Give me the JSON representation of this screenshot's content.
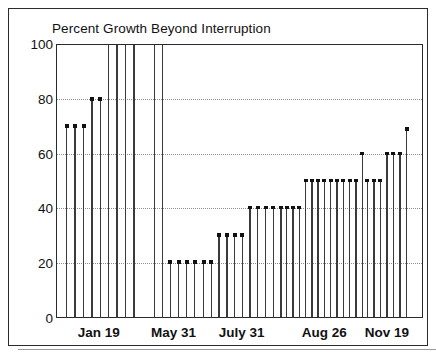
{
  "chart_data": {
    "type": "bar",
    "title": "Percent Growth Beyond Interruption",
    "xlabel": "",
    "ylabel": "",
    "ylim": [
      0,
      100
    ],
    "yticks": [
      0,
      20,
      40,
      60,
      80,
      100
    ],
    "ytick_labels": [
      "0",
      "20",
      "40",
      "60",
      "80",
      "100"
    ],
    "grid": "horizontal-dotted",
    "legend": "none",
    "xtick_labels": [
      "Jan 19",
      "May 31",
      "July 31",
      "Aug 26",
      "Nov 19"
    ],
    "groups": [
      {
        "label": "Jan 19",
        "center_pct": 18.0,
        "values": [
          70,
          70,
          70,
          80,
          80,
          100,
          100,
          100,
          100
        ]
      },
      {
        "label": "May 31",
        "center_pct": 39.5,
        "values": [
          100,
          100,
          20,
          20,
          20,
          20
        ]
      },
      {
        "label": "July 31",
        "center_pct": 54.5,
        "values": [
          20,
          20,
          30,
          30,
          30,
          30,
          40,
          40,
          40,
          40,
          40
        ]
      },
      {
        "label": "Aug 26",
        "center_pct": 74.5,
        "values": [
          40,
          40,
          40,
          50,
          50,
          50,
          50,
          50,
          50,
          50,
          50,
          50,
          60
        ]
      },
      {
        "label": "Nov 19",
        "center_pct": 92.5,
        "values": [
          50,
          50,
          50,
          60,
          60,
          60,
          69
        ]
      }
    ],
    "values": [
      70,
      70,
      70,
      80,
      80,
      100,
      100,
      100,
      100,
      100,
      100,
      20,
      20,
      20,
      20,
      20,
      20,
      30,
      30,
      30,
      30,
      40,
      40,
      40,
      40,
      40,
      40,
      40,
      40,
      50,
      50,
      50,
      50,
      50,
      50,
      50,
      50,
      50,
      60,
      50,
      50,
      50,
      60,
      60,
      60,
      69
    ],
    "x_positions_pct": [
      4.0,
      7.0,
      10.0,
      13.6,
      16.6,
      20.4,
      23.2,
      26.0,
      29.0,
      34.6,
      36.8,
      39.6,
      42.4,
      45.2,
      48.4,
      51.8,
      54.0,
      57.2,
      59.8,
      62.4,
      65.0,
      68.0,
      70.6,
      73.2,
      75.8,
      78.6,
      81.0,
      83.2,
      85.4,
      88.0,
      90.2,
      92.2,
      94.2,
      96.2,
      98.2,
      100.2,
      102.2,
      104.2,
      107.0,
      110.0,
      112.2,
      114.4,
      117.2,
      119.4,
      121.6,
      125.0
    ],
    "colors": {
      "stem": "#3a3a3a",
      "marker": "#111111",
      "axis": "#2b2b2b",
      "grid": "#8d8d8d",
      "background": "#ffffff"
    },
    "note": "Scanned stem/needle chart: each vertical needle is one observation, grouped by date tick."
  }
}
